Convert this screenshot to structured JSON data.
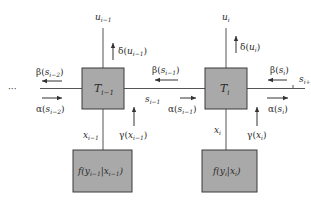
{
  "diagram": {
    "type": "factor-graph / forward-backward message passing",
    "colors": {
      "box_fill": "#a9a9a9",
      "box_stroke": "#3a3a3a",
      "line": "#555555",
      "text": "#2a2a2a"
    },
    "ellipsis": "···",
    "nodes": [
      {
        "id": "T_prev",
        "label_main": "T",
        "label_sub": "i−1"
      },
      {
        "id": "T_cur",
        "label_main": "T",
        "label_sub": "i"
      },
      {
        "id": "f_prev",
        "label": "f(y",
        "label_sub1": "i−1",
        "label_mid": "|x",
        "label_sub2": "i−1",
        "label_end": ")"
      },
      {
        "id": "f_cur",
        "label": "f(y",
        "label_sub1": "i",
        "label_mid": "|x",
        "label_sub2": "i",
        "label_end": ")"
      }
    ],
    "edge_labels": {
      "u_prev": {
        "main": "u",
        "sub": "i−1"
      },
      "u_cur": {
        "main": "u",
        "sub": "i"
      },
      "s_prev": {
        "main": "s",
        "sub": "i−1"
      },
      "s_next": {
        "main": "s",
        "sub": "i+1"
      },
      "x_prev": {
        "main": "x",
        "sub": "i−1"
      },
      "x_cur": {
        "main": "x",
        "sub": "i"
      }
    },
    "messages": {
      "delta_prev": {
        "greek": "δ",
        "arg": "u",
        "sub": "i−1"
      },
      "delta_cur": {
        "greek": "δ",
        "arg": "u",
        "sub": "i"
      },
      "beta_im2": {
        "greek": "β",
        "arg": "s",
        "sub": "i−2"
      },
      "alpha_im2": {
        "greek": "α",
        "arg": "s",
        "sub": "i−2"
      },
      "beta_im1": {
        "greek": "β",
        "arg": "s",
        "sub": "i−1"
      },
      "alpha_im1": {
        "greek": "α",
        "arg": "s",
        "sub": "i−1"
      },
      "beta_i": {
        "greek": "β",
        "arg": "s",
        "sub": "i"
      },
      "alpha_i": {
        "greek": "α",
        "arg": "s",
        "sub": "i"
      },
      "gamma_prev": {
        "greek": "γ",
        "arg": "x",
        "sub": "i−1"
      },
      "gamma_cur": {
        "greek": "γ",
        "arg": "x",
        "sub": "i"
      }
    }
  }
}
